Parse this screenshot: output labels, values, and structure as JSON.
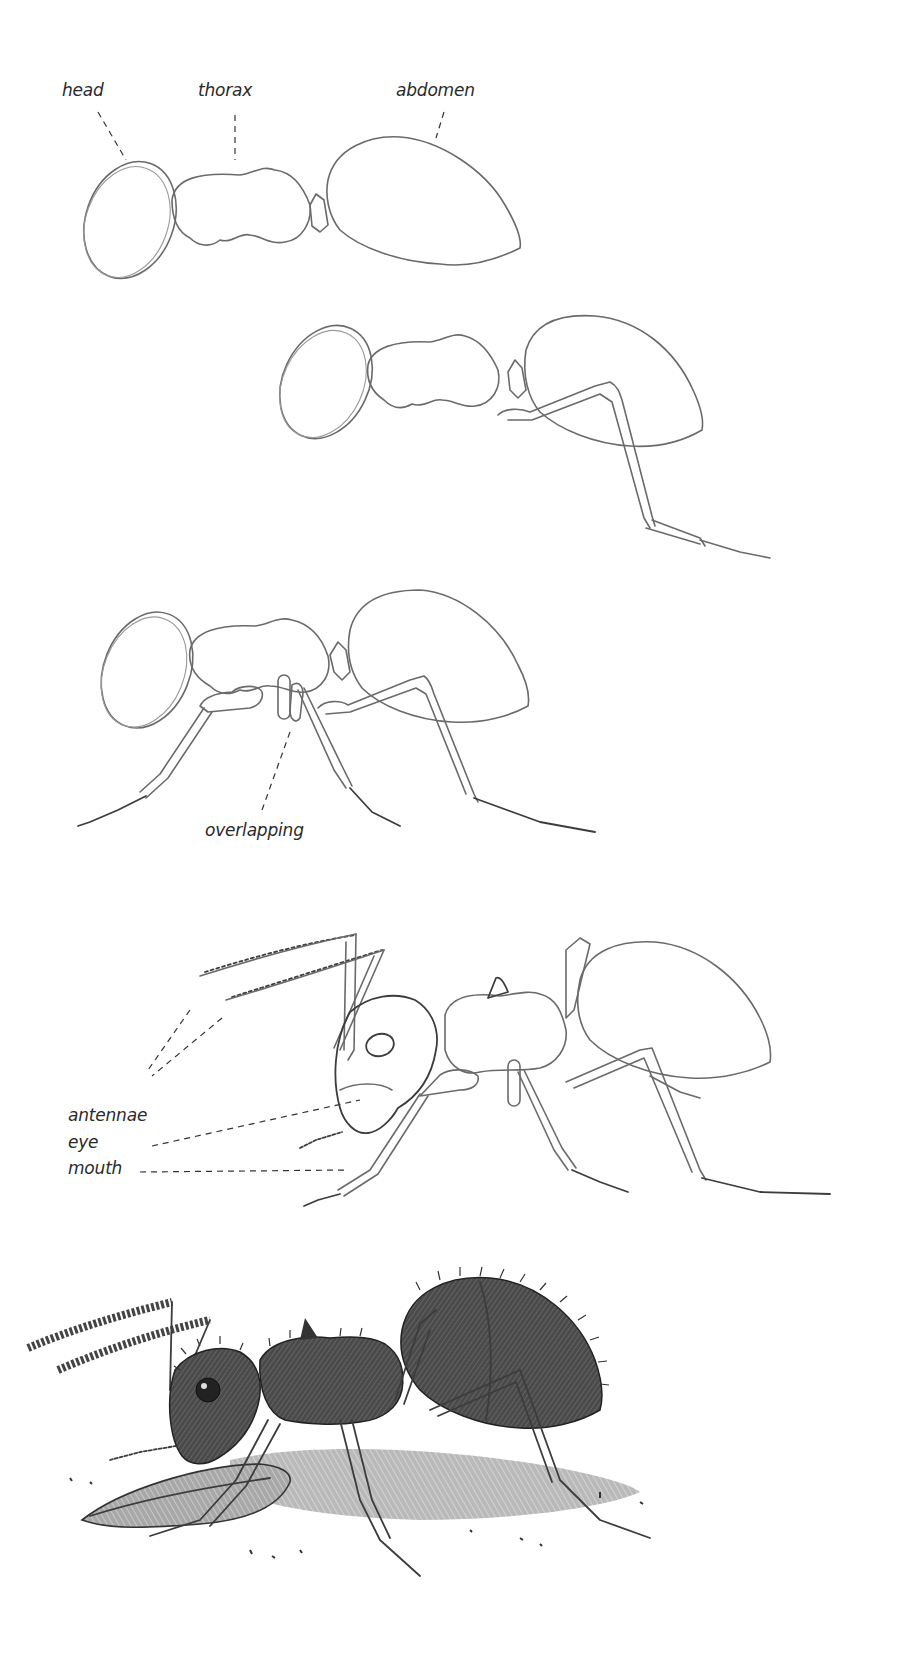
{
  "steps": [
    {
      "index": 1,
      "description": "Basic body shapes",
      "labels": {
        "head": "head",
        "thorax": "thorax",
        "abdomen": "abdomen"
      }
    },
    {
      "index": 2,
      "description": "Add first leg"
    },
    {
      "index": 3,
      "description": "Add remaining legs",
      "labels": {
        "overlapping": "overlapping"
      }
    },
    {
      "index": 4,
      "description": "Add head details",
      "labels": {
        "antennae": "antennae",
        "eye": "eye",
        "mouth": "mouth"
      }
    },
    {
      "index": 5,
      "description": "Shaded finished ant with wing fragment"
    }
  ],
  "colors": {
    "paper": "#ffffff",
    "pencil": "#6a6a6a",
    "label_text": "#2a2a2a",
    "shading": "#3a3a3a"
  }
}
